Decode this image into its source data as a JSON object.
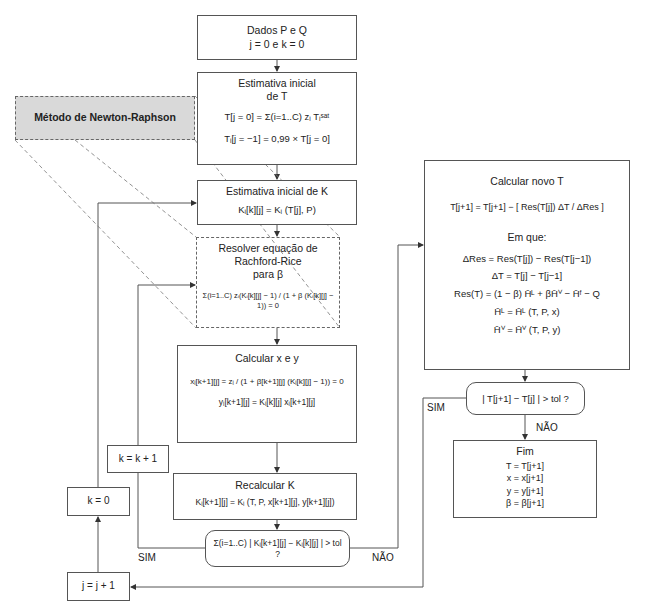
{
  "flowchart": {
    "start_box": {
      "line1": "Dados P e Q",
      "line2": "j = 0 e k = 0"
    },
    "initial_T_box": {
      "title_line1": "Estimativa inicial",
      "title_line2": "de T",
      "eq1": "T[j = 0] = Σ(i=1..C) zᵢ Tᵢˢᵃᵗ",
      "eq2": "Tᵢ[j = −1] = 0,99 × T[j = 0]"
    },
    "newton_raphson_label": "Método de Newton-Raphson",
    "initial_K_box": {
      "title": "Estimativa inicial de K",
      "eq": "Kᵢ[k][j] = Kᵢ (T[j], P)"
    },
    "rachford_rice_box": {
      "title_line1": "Resolver equação de",
      "title_line2": "Rachford-Rice",
      "title_line3": "para β",
      "eq": "Σ(i=1..C) zᵢ(Kᵢ[k][j] − 1) / (1 + β (Kᵢ[k][j] − 1)) = 0"
    },
    "calc_xy_box": {
      "title": "Calcular x e y",
      "eq1": "xᵢ[k+1][j] = zᵢ / (1 + β[k+1][j] (Kᵢ[k][j] − 1)) = 0",
      "eq2": "yᵢ[k+1][j] = Kᵢ[k][j] xᵢ[k+1][j]"
    },
    "recalc_K_box": {
      "title": "Recalcular K",
      "eq": "Kᵢ[k+1][j] = Kᵢ (T, P, x[k+1][j], y[k+1][j])"
    },
    "decision_K": {
      "text": "Σ(i=1..C) | Kᵢ[k+1][j] − Kᵢ[k][j] | > tol ?",
      "yes_label": "SIM",
      "no_label": "NÃO"
    },
    "k_increment_box": "k = k + 1",
    "k_reset_box": "k = 0",
    "j_increment_box": "j = j + 1",
    "new_T_box": {
      "title": "Calcular novo T",
      "eq_main": "T[j+1] = T[j+1] − [ Res(T[j]) ΔT / ΔRes ]",
      "em_que": "Em que:",
      "eq_dres": "ΔRes = Res(T[j]) − Res(T[j−1])",
      "eq_dt": "ΔT = T[j] − T[j−1]",
      "eq_res": "Res(T) = (1 − β) H̄ᴸ + βH̄ⱽ − H̄ᶠ − Q",
      "eq_hl": "H̄ᴸ = H̄ᴸ (T, P, x)",
      "eq_hv": "H̄ⱽ = H̄ⱽ (T, P, y)"
    },
    "decision_T": {
      "text": "| T[j+1] − T[j] | > tol ?",
      "yes_label": "SIM",
      "no_label": "NÃO"
    },
    "end_box": {
      "title": "Fim",
      "l1": "T = T[j+1]",
      "l2": "x = x[j+1]",
      "l3": "y = y[j+1]",
      "l4": "β = β[j+1]"
    }
  },
  "colors": {
    "line": "#555555",
    "nr_fill": "#d9d9d9",
    "dash": "#666666"
  }
}
